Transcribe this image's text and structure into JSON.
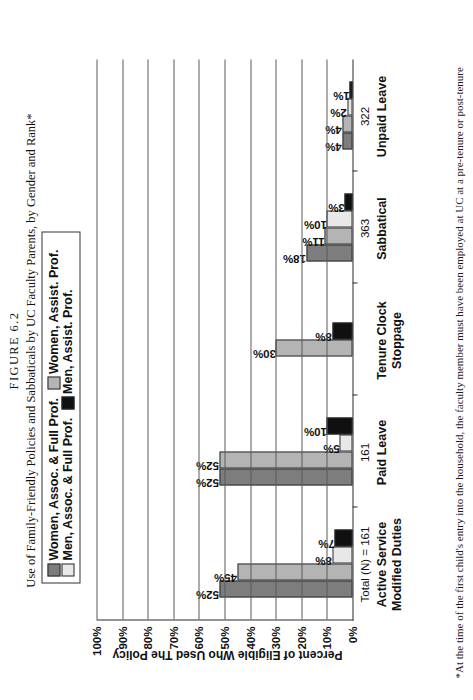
{
  "figure": {
    "number_label": "FIGURE 6.2",
    "title": "Use of Family-Friendly Policies and Sabbaticals by UC Faculty Parents, by Gender and Rank*",
    "footnote": "*At the time of the first child's entry into the household, the faculty member must have been employed at UC at a pre-tenure or post-tenure"
  },
  "legend": {
    "rows": [
      [
        {
          "label": "Women, Assoc. & Full Prof.",
          "color": "#7d7d7d",
          "swatch_class": "sw-wdark"
        },
        {
          "label": "Women, Assist. Prof.",
          "color": "#b4b4b4",
          "swatch_class": "sw-wmid"
        }
      ],
      [
        {
          "label": "Men, Assoc. & Full Prof.",
          "color": "#e8e8e8",
          "swatch_class": "sw-mlight"
        },
        {
          "label": "Men, Assist. Prof.",
          "color": "#101010",
          "swatch_class": "sw-mblack"
        }
      ]
    ]
  },
  "chart_data": {
    "type": "bar",
    "title": "Use of Family-Friendly Policies and Sabbaticals by UC Faculty Parents, by Gender and Rank*",
    "xlabel": "",
    "ylabel": "Percent of Eligible Who Used The Policy",
    "ylim": [
      0,
      100
    ],
    "yticks": [
      "0%",
      "10%",
      "20%",
      "30%",
      "40%",
      "50%",
      "60%",
      "70%",
      "80%",
      "90%",
      "100%"
    ],
    "grid": true,
    "legend_position": "top",
    "orientation": "vertical-bars-on-rotated-page",
    "categories": [
      "Active Service\nModified Duties",
      "Paid Leave",
      "Tenure Clock\nStoppage",
      "Sabbatical",
      "Unpaid Leave"
    ],
    "category_lines": [
      [
        "Active Service",
        "Modified Duties"
      ],
      [
        "Paid Leave"
      ],
      [
        "Tenure Clock",
        "Stoppage"
      ],
      [
        "Sabbatical"
      ],
      [
        "Unpaid Leave"
      ]
    ],
    "category_n_labels": [
      "Total (N) = 161",
      "161",
      "",
      "363",
      "322"
    ],
    "series": [
      {
        "name": "Women, Assoc. & Full Prof.",
        "color": "#7d7d7d",
        "values": [
          52,
          52,
          null,
          18,
          4
        ],
        "labels": [
          "52%",
          "52%",
          "",
          "18%",
          "4%"
        ]
      },
      {
        "name": "Women, Assist. Prof.",
        "color": "#b4b4b4",
        "values": [
          45,
          52,
          30,
          11,
          4
        ],
        "labels": [
          "45%",
          "52%",
          "30%",
          "11%",
          "4%"
        ]
      },
      {
        "name": "Men, Assoc. & Full Prof.",
        "color": "#e8e8e8",
        "values": [
          8,
          5,
          null,
          10,
          2
        ],
        "labels": [
          "8%",
          "5%",
          "",
          "10%",
          "2%"
        ]
      },
      {
        "name": "Men, Assist. Prof.",
        "color": "#101010",
        "values": [
          7,
          10,
          8,
          3,
          1
        ],
        "labels": [
          "7%",
          "10%",
          "8%",
          "3%",
          "1%"
        ]
      }
    ]
  }
}
